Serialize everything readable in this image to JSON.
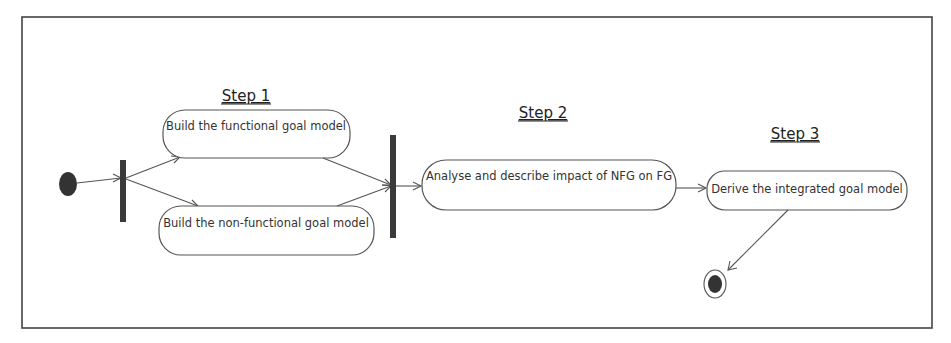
{
  "diagram": {
    "type": "UML activity diagram",
    "steps": [
      {
        "label": "Step 1"
      },
      {
        "label": "Step 2"
      },
      {
        "label": "Step 3"
      }
    ],
    "activities": [
      {
        "id": "a1",
        "label": "Build the functional goal model"
      },
      {
        "id": "a2",
        "label": "Build the non-functional goal model"
      },
      {
        "id": "a3",
        "label": "Analyse and describe impact of NFG on FG"
      },
      {
        "id": "a4",
        "label": "Derive the integrated goal model"
      }
    ],
    "nodes": {
      "start": "initial-node",
      "fork": "fork-bar",
      "join": "join-bar",
      "end": "final-node"
    },
    "edges": [
      {
        "from": "start",
        "to": "fork"
      },
      {
        "from": "fork",
        "to": "a1"
      },
      {
        "from": "fork",
        "to": "a2"
      },
      {
        "from": "a1",
        "to": "join"
      },
      {
        "from": "a2",
        "to": "join"
      },
      {
        "from": "join",
        "to": "a3"
      },
      {
        "from": "a3",
        "to": "a4"
      },
      {
        "from": "a4",
        "to": "end"
      }
    ],
    "colors": {
      "stroke": "#555555",
      "fill": "#3a3a3a",
      "background": "#ffffff"
    }
  }
}
